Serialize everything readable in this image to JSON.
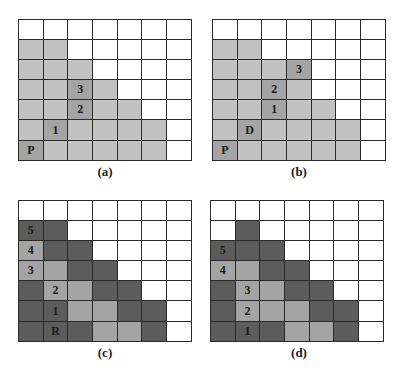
{
  "colors": {
    "white": "#ffffff",
    "light": "#c2c2c2",
    "medium": "#a4a4a4",
    "dark": "#5c5c5c",
    "grid_line": "#2a2a2a"
  },
  "panels": [
    {
      "id": "a",
      "caption": "(a)",
      "rows": [
        [
          "w",
          "w",
          "w",
          "w",
          "w",
          "w",
          "w"
        ],
        [
          "l",
          "l",
          "w",
          "w",
          "w",
          "w",
          "w"
        ],
        [
          "l",
          "l",
          "l",
          "w",
          "w",
          "w",
          "w"
        ],
        [
          "l",
          "l",
          "m",
          "l",
          "w",
          "w",
          "w"
        ],
        [
          "l",
          "l",
          "m",
          "l",
          "l",
          "w",
          "w"
        ],
        [
          "l",
          "m",
          "l",
          "l",
          "l",
          "l",
          "w"
        ],
        [
          "m",
          "l",
          "l",
          "l",
          "l",
          "l",
          "w"
        ]
      ],
      "labels": [
        [
          "",
          "",
          "",
          "",
          "",
          "",
          ""
        ],
        [
          "",
          "",
          "",
          "",
          "",
          "",
          ""
        ],
        [
          "",
          "",
          "",
          "",
          "",
          "",
          ""
        ],
        [
          "",
          "",
          "3",
          "",
          "",
          "",
          ""
        ],
        [
          "",
          "",
          "2",
          "",
          "",
          "",
          ""
        ],
        [
          "",
          "1",
          "",
          "",
          "",
          "",
          ""
        ],
        [
          "P",
          "",
          "",
          "",
          "",
          "",
          ""
        ]
      ]
    },
    {
      "id": "b",
      "caption": "(b)",
      "rows": [
        [
          "w",
          "w",
          "w",
          "w",
          "w",
          "w",
          "w"
        ],
        [
          "l",
          "l",
          "w",
          "w",
          "w",
          "w",
          "w"
        ],
        [
          "l",
          "l",
          "l",
          "m",
          "w",
          "w",
          "w"
        ],
        [
          "l",
          "l",
          "m",
          "l",
          "w",
          "w",
          "w"
        ],
        [
          "l",
          "l",
          "m",
          "l",
          "l",
          "w",
          "w"
        ],
        [
          "l",
          "m",
          "l",
          "l",
          "l",
          "l",
          "w"
        ],
        [
          "m",
          "l",
          "l",
          "l",
          "l",
          "l",
          "w"
        ]
      ],
      "labels": [
        [
          "",
          "",
          "",
          "",
          "",
          "",
          ""
        ],
        [
          "",
          "",
          "",
          "",
          "",
          "",
          ""
        ],
        [
          "",
          "",
          "",
          "3",
          "",
          "",
          ""
        ],
        [
          "",
          "",
          "2",
          "",
          "",
          "",
          ""
        ],
        [
          "",
          "",
          "1",
          "",
          "",
          "",
          ""
        ],
        [
          "",
          "D",
          "",
          "",
          "",
          "",
          ""
        ],
        [
          "P",
          "",
          "",
          "",
          "",
          "",
          ""
        ]
      ]
    },
    {
      "id": "c",
      "caption": "(c)",
      "rows": [
        [
          "w",
          "w",
          "w",
          "w",
          "w",
          "w",
          "w"
        ],
        [
          "d",
          "d",
          "w",
          "w",
          "w",
          "w",
          "w"
        ],
        [
          "m",
          "d",
          "d",
          "w",
          "w",
          "w",
          "w"
        ],
        [
          "m",
          "m",
          "d",
          "d",
          "w",
          "w",
          "w"
        ],
        [
          "d",
          "m",
          "m",
          "d",
          "d",
          "w",
          "w"
        ],
        [
          "d",
          "d",
          "m",
          "m",
          "d",
          "d",
          "w"
        ],
        [
          "d",
          "d",
          "d",
          "m",
          "m",
          "d",
          "w"
        ]
      ],
      "labels": [
        [
          "",
          "",
          "",
          "",
          "",
          "",
          ""
        ],
        [
          "5",
          "",
          "",
          "",
          "",
          "",
          ""
        ],
        [
          "4",
          "",
          "",
          "",
          "",
          "",
          ""
        ],
        [
          "3",
          "",
          "",
          "",
          "",
          "",
          ""
        ],
        [
          "",
          "2",
          "",
          "",
          "",
          "",
          ""
        ],
        [
          "",
          "1",
          "",
          "",
          "",
          "",
          ""
        ],
        [
          "",
          "R",
          "",
          "",
          "",
          "",
          ""
        ]
      ]
    },
    {
      "id": "d",
      "caption": "(d)",
      "rows": [
        [
          "w",
          "w",
          "w",
          "w",
          "w",
          "w",
          "w"
        ],
        [
          "w",
          "d",
          "w",
          "w",
          "w",
          "w",
          "w"
        ],
        [
          "d",
          "d",
          "d",
          "w",
          "w",
          "w",
          "w"
        ],
        [
          "m",
          "m",
          "d",
          "d",
          "w",
          "w",
          "w"
        ],
        [
          "d",
          "m",
          "m",
          "d",
          "d",
          "w",
          "w"
        ],
        [
          "d",
          "m",
          "m",
          "m",
          "d",
          "d",
          "w"
        ],
        [
          "d",
          "d",
          "d",
          "m",
          "m",
          "d",
          "w"
        ]
      ],
      "labels": [
        [
          "",
          "",
          "",
          "",
          "",
          "",
          ""
        ],
        [
          "",
          "",
          "",
          "",
          "",
          "",
          ""
        ],
        [
          "5",
          "",
          "",
          "",
          "",
          "",
          ""
        ],
        [
          "4",
          "",
          "",
          "",
          "",
          "",
          ""
        ],
        [
          "",
          "3",
          "",
          "",
          "",
          "",
          ""
        ],
        [
          "",
          "2",
          "",
          "",
          "",
          "",
          ""
        ],
        [
          "",
          "1",
          "",
          "",
          "",
          "",
          ""
        ]
      ]
    }
  ]
}
